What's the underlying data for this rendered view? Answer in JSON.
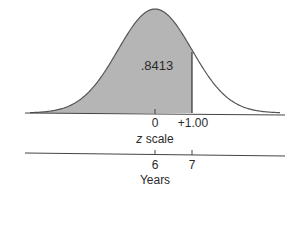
{
  "chart_data": {
    "type": "area",
    "title": "",
    "distribution": "normal",
    "mean_z": 0,
    "sd_z": 1,
    "shaded_region": {
      "from_z": "-inf",
      "to_z": 1.0,
      "area": 0.8413
    },
    "area_label": ".8413",
    "axes": [
      {
        "name": "z scale",
        "ticks": [
          {
            "value": 0,
            "label": "0"
          },
          {
            "value": 1.0,
            "label": "+1.00"
          }
        ]
      },
      {
        "name": "Years",
        "ticks": [
          {
            "value": 6,
            "label": "6"
          },
          {
            "value": 7,
            "label": "7"
          }
        ]
      }
    ],
    "colors": {
      "fill": "#b5b5b5",
      "line": "#555555"
    }
  },
  "labels": {
    "area": ".8413",
    "z_tick_0": "0",
    "z_tick_1": "+1.00",
    "z_axis_italic": "z",
    "z_axis_rest": " scale",
    "years_tick_6": "6",
    "years_tick_7": "7",
    "years_axis": "Years"
  }
}
